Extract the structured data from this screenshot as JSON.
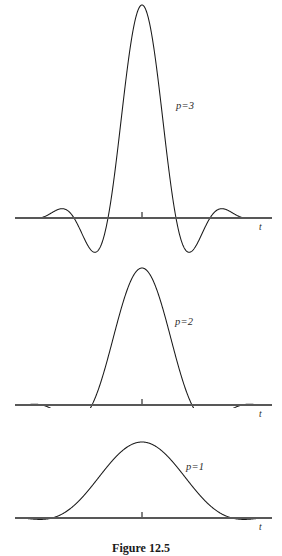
{
  "figure": {
    "caption": "Figure 12.5",
    "caption_top_px": 541,
    "background_color": "#ffffff",
    "curve_color": "#1a1a1a",
    "axis_color": "#585858"
  },
  "panels": [
    {
      "id": "panel-p3",
      "label": "p=3",
      "label_left": 176,
      "label_top": 100,
      "axis_label": "t",
      "axis_label_left": 259,
      "axis_label_top": 222,
      "top": 0,
      "height": 262,
      "axis_y": 218,
      "axis_x_start": 15,
      "axis_x_end": 272,
      "center_x": 142,
      "tick_height": 6,
      "peak_y": 5,
      "amplitude_px": 213,
      "lobe_half_width_px": 17,
      "cycles": 9,
      "envelope_half_width_px": 113
    },
    {
      "id": "panel-p2",
      "label": "p=2",
      "label_left": 175,
      "label_top": 316,
      "axis_label": "t",
      "axis_label_left": 259,
      "axis_label_top": 409,
      "top": 258,
      "height": 150,
      "axis_y": 405,
      "axis_x_start": 15,
      "axis_x_end": 272,
      "center_x": 142,
      "tick_height": 6,
      "peak_y": 268,
      "amplitude_px": 137,
      "lobe_half_width_px": 25,
      "cycles": 6,
      "envelope_half_width_px": 118
    },
    {
      "id": "panel-p1",
      "label": "p=1",
      "label_left": 186,
      "label_top": 461,
      "axis_label": "t",
      "axis_label_left": 259,
      "axis_label_top": 522,
      "top": 424,
      "height": 116,
      "axis_y": 518,
      "axis_x_start": 15,
      "axis_x_end": 272,
      "center_x": 142,
      "tick_height": 6,
      "peak_y": 442,
      "amplitude_px": 76,
      "lobe_half_width_px": 45,
      "cycles": 2,
      "envelope_half_width_px": 120
    }
  ],
  "chart_data": {
    "type": "line",
    "title": "Figure 12.5",
    "subtitle": "Prolate-spheroidal / modulated sinc pulse waveforms for p = 1, 2, 3",
    "xlabel": "t",
    "ylabel": "",
    "grid": false,
    "legend": false,
    "annotations": [
      "p=3",
      "p=2",
      "p=1"
    ],
    "xtick_labels": [],
    "ytick_labels": [],
    "series": [
      {
        "name": "p=3",
        "peak_value": 1.0,
        "main_lobe_half_width": 0.15,
        "oscillation_cycles": 9,
        "sidelobe_peaks": [
          0.26,
          -0.3,
          0.2,
          -0.15,
          0.12,
          -0.09,
          0.07,
          -0.05
        ],
        "x_range": [
          -1,
          1
        ]
      },
      {
        "name": "p=2",
        "peak_value": 1.0,
        "main_lobe_half_width": 0.21,
        "oscillation_cycles": 6,
        "sidelobe_peaks": [
          0.14,
          -0.16,
          0.1,
          -0.08,
          0.06,
          -0.04
        ],
        "x_range": [
          -1,
          1
        ]
      },
      {
        "name": "p=1",
        "peak_value": 1.0,
        "main_lobe_half_width": 0.38,
        "oscillation_cycles": 2,
        "sidelobe_peaks": [
          0.22,
          -0.24
        ],
        "x_range": [
          -1,
          1
        ]
      }
    ]
  }
}
